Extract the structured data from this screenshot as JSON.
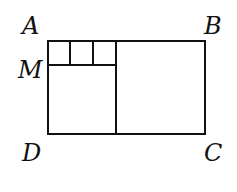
{
  "diagram": {
    "type": "geometry",
    "labels": {
      "A": "A",
      "B": "B",
      "C": "C",
      "D": "D",
      "M": "M"
    },
    "stroke_color": "#111111",
    "background": "#ffffff"
  }
}
